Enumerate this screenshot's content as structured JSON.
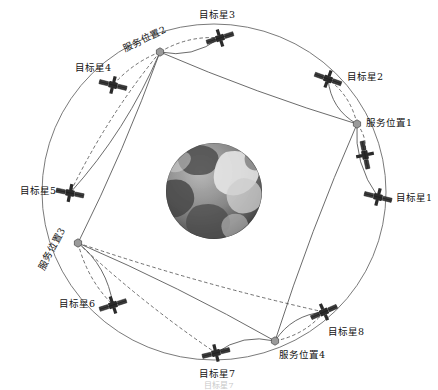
{
  "figure": {
    "type": "orbital-servicing-diagram",
    "background": "#ffffff",
    "ink": "#333333",
    "earth": {
      "name": "earth-globe",
      "cx": 214,
      "cy": 191,
      "r": 48,
      "style": "grayscale-satellite-texture"
    },
    "orbit": {
      "name": "outer-orbit-ring",
      "cx": 214,
      "cy": 192,
      "rx": 172,
      "ry": 168,
      "stroke": "#6b6b6b"
    },
    "caption": "目标星7"
  },
  "legend_colors": {
    "service_node": "#9a9a9a",
    "service_node_edge": "#555555",
    "satellite_body": "#2b2b2b",
    "transfer_solid": "#5a5a5a",
    "transfer_dashed": "#4a4a4a"
  },
  "service_positions": [
    {
      "id": "service-1",
      "label": "服务位置1",
      "x": 357,
      "y": 124,
      "label_x": 366,
      "label_y": 118,
      "rotated": false
    },
    {
      "id": "service-2",
      "label": "服务位置2",
      "x": 160,
      "y": 52,
      "label_x": 126,
      "label_y": 44,
      "rotated": true
    },
    {
      "id": "service-3",
      "label": "服务位置3",
      "x": 78,
      "y": 243,
      "label_x": 45,
      "label_y": 262,
      "rotated": true
    },
    {
      "id": "service-4",
      "label": "服务位置4",
      "x": 275,
      "y": 341,
      "label_x": 279,
      "label_y": 350,
      "rotated": false
    }
  ],
  "target_satellites": [
    {
      "id": "target-1",
      "label": "目标星1",
      "x": 378,
      "y": 197,
      "label_x": 396,
      "label_y": 193,
      "angle": 14
    },
    {
      "id": "target-2",
      "label": "目标星2",
      "x": 328,
      "y": 79,
      "label_x": 347,
      "label_y": 72,
      "angle": 20
    },
    {
      "id": "target-3",
      "label": "目标星3",
      "x": 220,
      "y": 38,
      "label_x": 199,
      "label_y": 10,
      "angle": -18
    },
    {
      "id": "target-4",
      "label": "目标星4",
      "x": 113,
      "y": 85,
      "label_x": 75,
      "label_y": 63,
      "angle": 14
    },
    {
      "id": "target-5",
      "label": "目标星5",
      "x": 70,
      "y": 193,
      "label_x": 20,
      "label_y": 186,
      "angle": 12
    },
    {
      "id": "target-6",
      "label": "目标星6",
      "x": 113,
      "y": 305,
      "label_x": 59,
      "label_y": 299,
      "angle": -18
    },
    {
      "id": "target-7",
      "label": "目标星7",
      "x": 216,
      "y": 353,
      "label_x": 199,
      "label_y": 369,
      "angle": -14
    },
    {
      "id": "target-8",
      "label": "目标星8",
      "x": 324,
      "y": 312,
      "label_x": 328,
      "label_y": 327,
      "angle": -24
    },
    {
      "id": "target-9",
      "label": "",
      "x": 365,
      "y": 155,
      "label_x": 0,
      "label_y": 0,
      "angle": 78
    }
  ],
  "transfers": [
    {
      "from": "service-2",
      "to": "target-3",
      "style": "solid"
    },
    {
      "from": "service-2",
      "to": "target-3",
      "style": "dashed"
    },
    {
      "from": "service-2",
      "to": "target-4",
      "style": "dashed"
    },
    {
      "from": "service-2",
      "to": "target-5",
      "style": "solid"
    },
    {
      "from": "service-2",
      "to": "target-5",
      "style": "dashed"
    },
    {
      "from": "service-1",
      "to": "target-2",
      "style": "solid"
    },
    {
      "from": "service-1",
      "to": "target-2",
      "style": "dashed"
    },
    {
      "from": "service-1",
      "to": "target-9",
      "style": "dashed"
    },
    {
      "from": "service-1",
      "to": "target-1",
      "style": "solid"
    },
    {
      "from": "service-3",
      "to": "target-6",
      "style": "solid"
    },
    {
      "from": "service-3",
      "to": "target-6",
      "style": "dashed"
    },
    {
      "from": "service-3",
      "to": "target-7",
      "style": "dashed"
    },
    {
      "from": "service-3",
      "to": "target-8",
      "style": "dashed"
    },
    {
      "from": "service-4",
      "to": "target-8",
      "style": "solid"
    },
    {
      "from": "service-4",
      "to": "target-8",
      "style": "dashed"
    },
    {
      "from": "service-4",
      "to": "target-7",
      "style": "solid"
    }
  ],
  "polygon_chain": [
    {
      "from": "service-2",
      "to": "service-1"
    },
    {
      "from": "service-1",
      "to": "service-4"
    },
    {
      "from": "service-4",
      "to": "service-3"
    },
    {
      "from": "service-3",
      "to": "service-2"
    }
  ]
}
